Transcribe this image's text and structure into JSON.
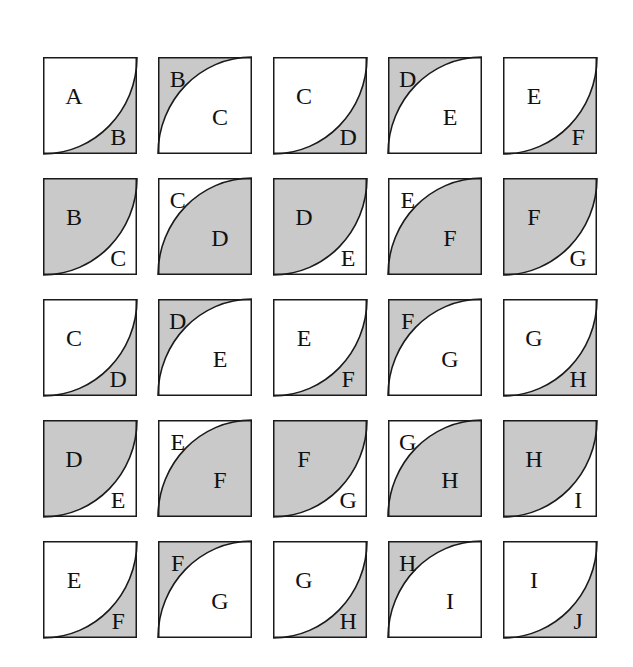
{
  "colors": {
    "shade": "#c9c9c9",
    "paper": "#ffffff",
    "stroke": "#1a1a1a"
  },
  "layout": {
    "origin_x": 43,
    "origin_y": 57,
    "pitch_x": 115,
    "pitch_y": 121,
    "tile_w": 94,
    "tile_h": 97
  },
  "legend": {
    "type1": "curve bulging toward bottom-right; first label upper-left region, second label lower-right corner region",
    "type2": "curve bulging toward top-left; first label top-left corner region, second label lower-right region"
  },
  "rows": [
    {
      "shade_mode": "small",
      "tiles": [
        {
          "type": 1,
          "a": "A",
          "b": "B"
        },
        {
          "type": 2,
          "a": "B",
          "b": "C"
        },
        {
          "type": 1,
          "a": "C",
          "b": "D"
        },
        {
          "type": 2,
          "a": "D",
          "b": "E"
        },
        {
          "type": 1,
          "a": "E",
          "b": "F"
        }
      ]
    },
    {
      "shade_mode": "large",
      "tiles": [
        {
          "type": 1,
          "a": "B",
          "b": "C"
        },
        {
          "type": 2,
          "a": "C",
          "b": "D"
        },
        {
          "type": 1,
          "a": "D",
          "b": "E"
        },
        {
          "type": 2,
          "a": "E",
          "b": "F"
        },
        {
          "type": 1,
          "a": "F",
          "b": "G"
        }
      ]
    },
    {
      "shade_mode": "small",
      "tiles": [
        {
          "type": 1,
          "a": "C",
          "b": "D"
        },
        {
          "type": 2,
          "a": "D",
          "b": "E"
        },
        {
          "type": 1,
          "a": "E",
          "b": "F"
        },
        {
          "type": 2,
          "a": "F",
          "b": "G"
        },
        {
          "type": 1,
          "a": "G",
          "b": "H"
        }
      ]
    },
    {
      "shade_mode": "large",
      "tiles": [
        {
          "type": 1,
          "a": "D",
          "b": "E"
        },
        {
          "type": 2,
          "a": "E",
          "b": "F"
        },
        {
          "type": 1,
          "a": "F",
          "b": "G"
        },
        {
          "type": 2,
          "a": "G",
          "b": "H"
        },
        {
          "type": 1,
          "a": "H",
          "b": "I"
        }
      ]
    },
    {
      "shade_mode": "small",
      "tiles": [
        {
          "type": 1,
          "a": "E",
          "b": "F"
        },
        {
          "type": 2,
          "a": "F",
          "b": "G"
        },
        {
          "type": 1,
          "a": "G",
          "b": "H"
        },
        {
          "type": 2,
          "a": "H",
          "b": "I"
        },
        {
          "type": 1,
          "a": "I",
          "b": "J"
        }
      ]
    }
  ]
}
